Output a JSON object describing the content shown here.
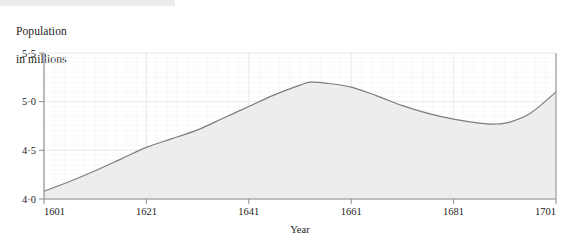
{
  "page": {
    "background_color": "#ffffff",
    "top_bar_color": "#ebebeb"
  },
  "chart_data": {
    "type": "area",
    "title": "",
    "ylabel_lines": [
      "Population",
      "in millions"
    ],
    "xlabel": "Year",
    "xlim": [
      1601,
      1701
    ],
    "ylim": [
      4.0,
      5.5
    ],
    "yticks": [
      4.0,
      4.5,
      5.0,
      5.5
    ],
    "ytick_labels": [
      "4·0",
      "4·5",
      "5·0",
      "5·5"
    ],
    "xticks": [
      1601,
      1621,
      1641,
      1661,
      1681,
      1701
    ],
    "xtick_labels": [
      "1601",
      "1621",
      "1641",
      "1661",
      "1681",
      "1701"
    ],
    "grid": true,
    "grid_minor": true,
    "legend": "none",
    "line_color": "#7d7d7d",
    "fill_color": "#ededed",
    "grid_color": "#e9e9e9",
    "grid_minor_color": "#f4f4f4",
    "axis_color": "#999999",
    "x": [
      1601,
      1606,
      1611,
      1616,
      1621,
      1626,
      1631,
      1636,
      1641,
      1646,
      1651,
      1653,
      1656,
      1661,
      1666,
      1671,
      1676,
      1681,
      1686,
      1689,
      1692,
      1696,
      1701
    ],
    "values": [
      4.08,
      4.18,
      4.29,
      4.41,
      4.53,
      4.62,
      4.71,
      4.83,
      4.95,
      5.07,
      5.17,
      5.2,
      5.19,
      5.15,
      5.06,
      4.96,
      4.88,
      4.82,
      4.78,
      4.77,
      4.79,
      4.88,
      5.1
    ],
    "series_name": "Population in millions",
    "annotations": []
  },
  "axis_title": {
    "line1": "Population",
    "line2": "in millions"
  },
  "xaxis": {
    "name": "Year"
  }
}
